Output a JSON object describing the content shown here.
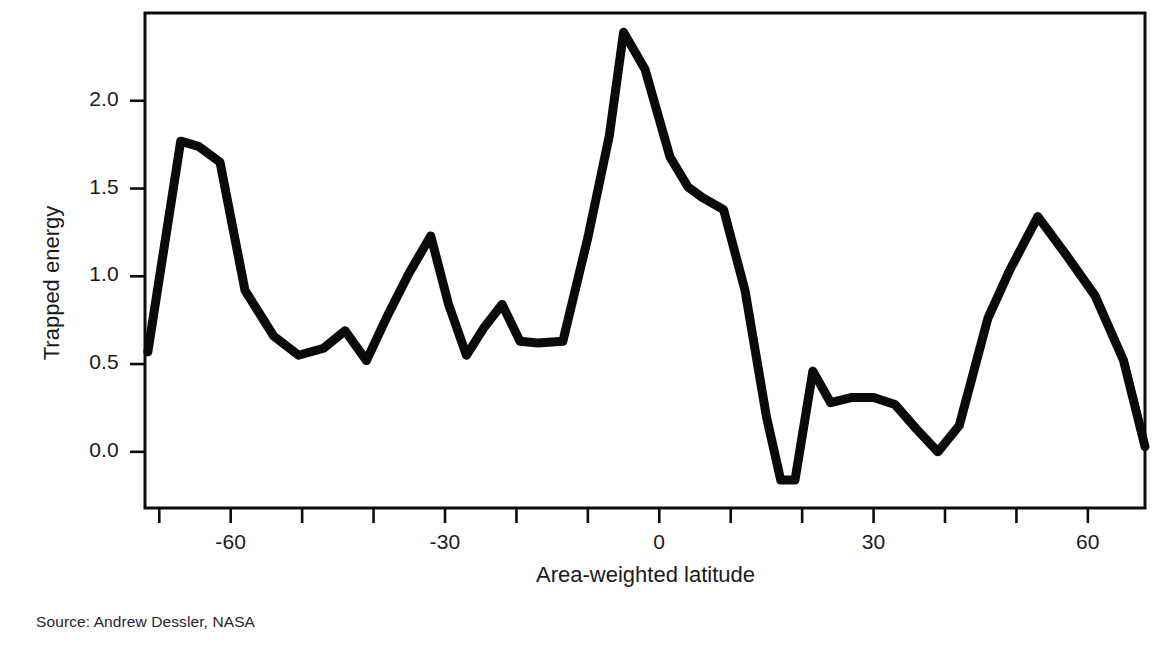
{
  "figure": {
    "source_note": "Source: Andrew Dessler, NASA",
    "top_cropped_text": "",
    "line_color": "#0a0a0a",
    "axis_color": "#0d0d0d",
    "background_color": "#ffffff"
  },
  "chart_data": {
    "type": "line",
    "title": "",
    "xlabel": "Area-weighted latitude",
    "ylabel": "Trapped energy",
    "xlim": [
      -72,
      68
    ],
    "ylim": [
      -0.32,
      2.5
    ],
    "grid": false,
    "legend": false,
    "legend_position": "none",
    "xticks": [
      -70,
      -60,
      -50,
      -40,
      -30,
      -20,
      -10,
      0,
      10,
      20,
      30,
      40,
      50,
      60
    ],
    "xtick_labels": [
      "",
      "-60",
      "",
      "",
      "-30",
      "",
      "",
      "0",
      "",
      "",
      "30",
      "",
      "",
      "60"
    ],
    "xtick_labels_shown": [
      "-60",
      "-30",
      "0",
      "30",
      "60"
    ],
    "yticks": [
      0.0,
      0.5,
      1.0,
      1.5,
      2.0
    ],
    "ytick_labels": [
      "0.0",
      "0.5",
      "1.0",
      "1.5",
      "2.0"
    ],
    "series": [
      {
        "name": "Trapped energy",
        "color": "#0a0a0a",
        "x": [
          -71.6,
          -67.0,
          -64.5,
          -61.5,
          -58.0,
          -54.0,
          -50.5,
          -47.0,
          -44.0,
          -41.0,
          -38.0,
          -35.0,
          -32.0,
          -29.5,
          -27.0,
          -24.5,
          -22.0,
          -19.5,
          -17.0,
          -13.5,
          -10.0,
          -7.0,
          -5.0,
          -2.0,
          1.5,
          4.0,
          6.0,
          9.0,
          12.0,
          15.0,
          17.0,
          19.0,
          21.5,
          24.0,
          27.0,
          30.0,
          33.0,
          36.0,
          39.0,
          42.0,
          46.0,
          49.0,
          53.0,
          57.0,
          61.0,
          65.0,
          68.0
        ],
        "y": [
          0.57,
          1.77,
          1.74,
          1.65,
          0.92,
          0.66,
          0.55,
          0.59,
          0.69,
          0.52,
          0.78,
          1.02,
          1.23,
          0.84,
          0.55,
          0.71,
          0.84,
          0.63,
          0.62,
          0.63,
          1.22,
          1.8,
          2.39,
          2.18,
          1.68,
          1.51,
          1.45,
          1.38,
          0.92,
          0.2,
          -0.16,
          -0.16,
          0.46,
          0.28,
          0.31,
          0.31,
          0.27,
          0.13,
          0.0,
          0.15,
          0.76,
          1.03,
          1.34,
          1.12,
          0.89,
          0.52,
          0.03
        ]
      }
    ],
    "annotations": []
  }
}
